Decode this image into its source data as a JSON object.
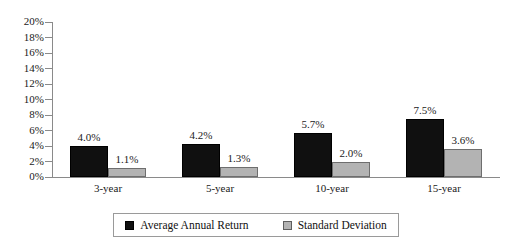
{
  "chart_data": {
    "type": "bar",
    "title": "",
    "subtitle": "",
    "xlabel": "",
    "ylabel": "",
    "categories": [
      "3-year",
      "5-year",
      "10-year",
      "15-year"
    ],
    "series": [
      {
        "name": "Average Annual Return",
        "color": "#101010",
        "values": [
          4.0,
          4.2,
          5.7,
          7.5
        ],
        "labels": [
          "4.0%",
          "4.2%",
          "5.7%",
          "7.5%"
        ]
      },
      {
        "name": "Standard Deviation",
        "color": "#b3b3b3",
        "values": [
          1.1,
          1.3,
          2.0,
          3.6
        ],
        "labels": [
          "1.1%",
          "1.3%",
          "2.0%",
          "3.6%"
        ]
      }
    ],
    "ylim": [
      0,
      20
    ],
    "ytick_values": [
      20,
      18,
      16,
      14,
      12,
      10,
      8,
      6,
      4,
      2,
      0
    ],
    "ytick_labels": [
      "20%",
      "18%",
      "16%",
      "14%",
      "12%",
      "10%",
      "8%",
      "6%",
      "4%",
      "2%",
      "0%"
    ],
    "grid": false,
    "legend_position": "bottom",
    "legend_entries": [
      "Average Annual Return",
      "Standard Deviation"
    ]
  }
}
